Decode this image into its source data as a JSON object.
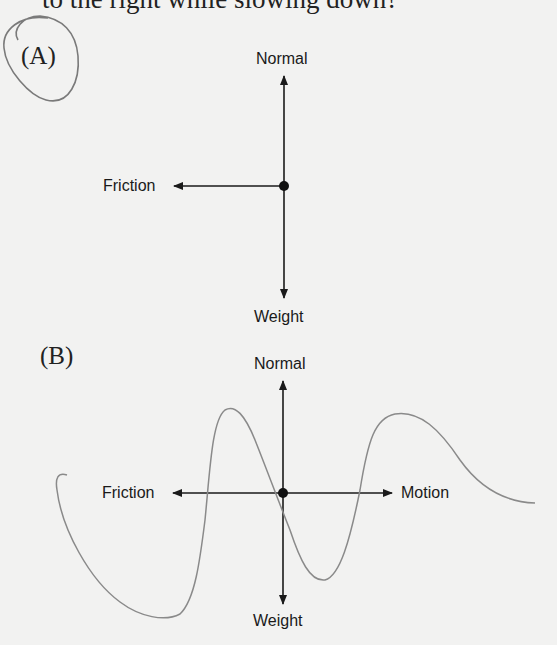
{
  "question": {
    "text_fragment": "to the right while slowing down?"
  },
  "options": [
    {
      "label": "(A)",
      "circled": true,
      "forces": {
        "up": "Normal",
        "down": "Weight",
        "left": "Friction"
      }
    },
    {
      "label": "(B)",
      "circled": false,
      "crossed_out_scribble": true,
      "forces": {
        "up": "Normal",
        "down": "Weight",
        "left": "Friction",
        "right": "Motion"
      }
    }
  ],
  "colors": {
    "background": "#f2f2f1",
    "ink": "#1a1a1a",
    "pencil": "#8a8a8a"
  }
}
